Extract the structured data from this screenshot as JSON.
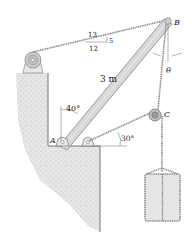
{
  "diagram": {
    "type": "statics-mechanism",
    "labels": {
      "point_a": "A",
      "point_b": "B",
      "point_c": "C",
      "boom_length": "3 m",
      "angle_boom": "40°",
      "angle_cable": "30°",
      "theta": "θ",
      "slope_hyp": "13",
      "slope_rise": "5",
      "slope_run": "12"
    },
    "colors": {
      "wall_fill": "#e2e2e2",
      "wall_dots": "#b8b8b8",
      "boom_fill": "#d8d8d8",
      "boom_stroke": "#7a7a7a",
      "cable": "#8a8a8a",
      "pulley": "#9a9a9a",
      "crate_fill": "#e6e6e6",
      "text": "#222222"
    }
  }
}
